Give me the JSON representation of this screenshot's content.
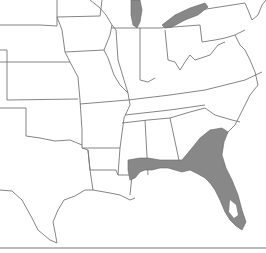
{
  "map": {
    "type": "species-range-map",
    "region": "Southeastern and central United States",
    "colors": {
      "background": "#ffffff",
      "state_border": "#777777",
      "range_fill": "#888888"
    },
    "shaded_areas": [
      "Florida",
      "Southern Georgia",
      "Southeastern Alabama",
      "Southern Mississippi coast",
      "Southeastern Louisiana",
      "Lake Michigan",
      "Lake Erie"
    ],
    "labels": []
  }
}
